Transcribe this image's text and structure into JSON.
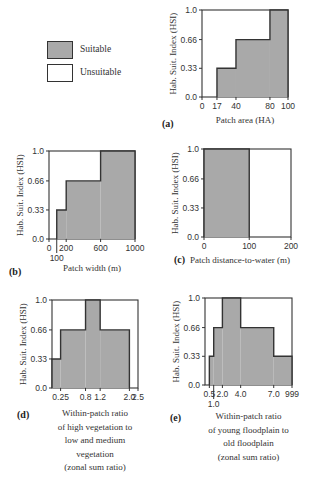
{
  "legend": {
    "items": [
      {
        "label": "Suitable",
        "color": "#a9a9a9"
      },
      {
        "label": "Unsuitable",
        "color": "#ffffff"
      }
    ]
  },
  "colors": {
    "fill": "#a9a9a9",
    "line": "#333333"
  },
  "chart_data": [
    {
      "panel": "(a)",
      "type": "area",
      "title": "",
      "xlabel": [
        "Patch area (HA)"
      ],
      "ylabel": "Hab. Suit. Index (HSI)",
      "yticks": [
        "0.0",
        "0.33",
        "0.66",
        "1.0"
      ],
      "xticks": [
        {
          "label": "0",
          "pos": 0
        },
        {
          "label": "17",
          "pos": 17
        },
        {
          "label": "40",
          "pos": 40
        },
        {
          "label": "80",
          "pos": 80
        },
        {
          "label": "100",
          "pos": 100
        }
      ],
      "xlim": [
        0,
        100
      ],
      "ylim": [
        0,
        1.0
      ],
      "steps": [
        {
          "x0": 0,
          "x1": 17,
          "y": 0
        },
        {
          "x0": 17,
          "x1": 40,
          "y": 0.33
        },
        {
          "x0": 40,
          "x1": 80,
          "y": 0.66
        },
        {
          "x0": 80,
          "x1": 100,
          "y": 1.0
        }
      ],
      "box": {
        "x": 202,
        "y": 10,
        "w": 86,
        "h": 87
      }
    },
    {
      "panel": "(b)",
      "type": "area",
      "xlabel": [
        "Patch width (m)"
      ],
      "ylabel": "Hab. Suit. Index (HSI)",
      "yticks": [
        "0.0",
        "0.33",
        "0.66",
        "1.0"
      ],
      "xticks": [
        {
          "label": "0",
          "pos": 0
        },
        {
          "label": "100",
          "pos": 100,
          "below": true
        },
        {
          "label": "200",
          "pos": 200
        },
        {
          "label": "600",
          "pos": 600
        },
        {
          "label": "1000",
          "pos": 1000
        }
      ],
      "xlim": [
        0,
        1000
      ],
      "ylim": [
        0,
        1.0
      ],
      "steps": [
        {
          "x0": 0,
          "x1": 100,
          "y": 0
        },
        {
          "x0": 100,
          "x1": 200,
          "y": 0.33
        },
        {
          "x0": 200,
          "x1": 600,
          "y": 0.66
        },
        {
          "x0": 600,
          "x1": 1000,
          "y": 1.0
        }
      ],
      "box": {
        "x": 49,
        "y": 151,
        "w": 86,
        "h": 88
      }
    },
    {
      "panel": "(c)",
      "type": "area",
      "xlabel": [
        "Patch distance-to-water (m)"
      ],
      "ylabel": "Hab. Suit. Index (HSI)",
      "yticks": [
        "0.0",
        "0.33",
        "0.66",
        "1.0"
      ],
      "xticks": [
        {
          "label": "0",
          "pos": 0
        },
        {
          "label": "100",
          "pos": 100
        },
        {
          "label": "200",
          "pos": 200
        }
      ],
      "xlim": [
        0,
        200
      ],
      "ylim": [
        0,
        1.0
      ],
      "steps": [
        {
          "x0": 0,
          "x1": 100,
          "y": 1.0
        },
        {
          "x0": 100,
          "x1": 200,
          "y": 0
        }
      ],
      "box": {
        "x": 204,
        "y": 149,
        "w": 87,
        "h": 88
      }
    },
    {
      "panel": "(d)",
      "type": "area",
      "xlabel": [
        "Within-patch ratio",
        "of high vegetation to",
        "low and medium",
        "vegetation",
        "(zonal sum ratio)"
      ],
      "ylabel": "Hab. Suit. Index (HSI)",
      "yticks": [
        "0.0",
        "0.33",
        "0.66",
        "1.0"
      ],
      "xticks": [
        {
          "label": "0.25",
          "pos": 0.25
        },
        {
          "label": "0.8",
          "pos": 0.8
        },
        {
          "label": "1.2",
          "pos": 1.2
        },
        {
          "label": "2.0",
          "pos": 2.0
        },
        {
          "label": "2.5",
          "pos": 2.5
        }
      ],
      "xlim": [
        0,
        2.5
      ],
      "ylim": [
        0,
        1.0
      ],
      "steps": [
        {
          "x0": 0,
          "x1": 0.25,
          "y": 0.33
        },
        {
          "x0": 0.25,
          "x1": 0.8,
          "y": 0.66
        },
        {
          "x0": 0.8,
          "x1": 1.2,
          "y": 1.0
        },
        {
          "x0": 1.2,
          "x1": 2.0,
          "y": 0.66
        },
        {
          "x0": 2.0,
          "x1": 2.5,
          "y": 0
        }
      ],
      "box": {
        "x": 52,
        "y": 300,
        "w": 86,
        "h": 88
      }
    },
    {
      "panel": "(e)",
      "type": "area",
      "xlabel": [
        "Within-patch ratio",
        "of young floodplain to",
        "old floodplain",
        "(zonal sum ratio)"
      ],
      "ylabel": "Hab. Suit. Index (HSI)",
      "yticks": [
        "0.0",
        "0.33",
        "0.66",
        "1.0"
      ],
      "xticks": [
        {
          "label": "0.5",
          "pos": 0.5
        },
        {
          "label": "1.0",
          "pos": 1.0,
          "below": true
        },
        {
          "label": "2.0",
          "pos": 2.0
        },
        {
          "label": "4.0",
          "pos": 4.0
        },
        {
          "label": "7.0",
          "pos": 7.0
        },
        {
          "label": "999",
          "pos": 999
        }
      ],
      "xlim": [
        0,
        999
      ],
      "ylim": [
        0,
        1.0
      ],
      "steps": [
        {
          "x0": 0.5,
          "x1": 1.0,
          "y": 0.33
        },
        {
          "x0": 1.0,
          "x1": 2.0,
          "y": 0.66
        },
        {
          "x0": 2.0,
          "x1": 4.0,
          "y": 1.0
        },
        {
          "x0": 4.0,
          "x1": 7.0,
          "y": 0.66
        },
        {
          "x0": 7.0,
          "x1": 999,
          "y": 0.33
        }
      ],
      "box": {
        "x": 205,
        "y": 298,
        "w": 87,
        "h": 87
      }
    }
  ]
}
